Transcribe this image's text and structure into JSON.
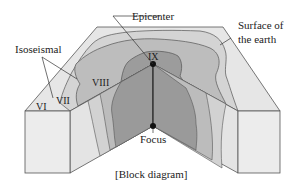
{
  "diagram": {
    "caption": "[Block diagram]",
    "labels": {
      "epicenter": "Epicenter",
      "surface_line1": "Surface of",
      "surface_line2": "the earth",
      "isoseismal": "Isoseismal",
      "focus": "Focus"
    },
    "intensity_zones": {
      "vi": "VI",
      "vii": "VII",
      "viii": "VIII",
      "ix": "IX"
    },
    "colors": {
      "outline": "#555555",
      "zone_vi": "#e8e8e8",
      "zone_vii": "#d6d6d6",
      "zone_viii": "#bdbdbd",
      "zone_ix": "#9a9a9a",
      "side_face": "#ececec",
      "point": "#111111"
    }
  }
}
